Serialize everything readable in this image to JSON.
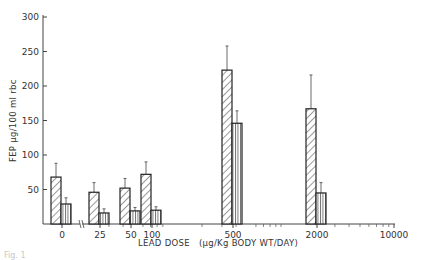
{
  "chart_data": {
    "type": "bar",
    "title": "",
    "xlabel": "LEAD DOSE (µg/Kg BODY WT/DAY)",
    "ylabel": "FEP µg/100 ml rbc",
    "ylim": [
      0,
      300
    ],
    "yticks": [
      50,
      100,
      150,
      200,
      250,
      300
    ],
    "categories": [
      "0",
      "25",
      "50",
      "100",
      "500",
      "2000"
    ],
    "x_tick_labels": [
      "0",
      "25",
      "50",
      "100",
      "500",
      "2000",
      "10000"
    ],
    "x_scale": "log (with axis break between 0 and 25)",
    "grid": false,
    "legend": null,
    "series": [
      {
        "name": "hatched (diagonal)",
        "pattern": "diagonal-hatch",
        "values": [
          68,
          46,
          52,
          72,
          223,
          167
        ],
        "error_upper": [
          88,
          60,
          66,
          90,
          258,
          216
        ]
      },
      {
        "name": "vertical-lined",
        "pattern": "vertical-lines",
        "values": [
          29,
          16,
          19,
          20,
          146,
          45
        ],
        "error_upper": [
          38,
          22,
          24,
          25,
          164,
          60
        ]
      }
    ]
  },
  "axes": {
    "y_title": "FEP µg/100 ml rbc",
    "x_title": "LEAD DOSE   (µg/Kg BODY WT/DAY)",
    "y_ticks": [
      "50",
      "100",
      "150",
      "200",
      "250",
      "300"
    ],
    "x_ticks": [
      "0",
      "25",
      "50",
      "100",
      "500",
      "2000",
      "10000"
    ]
  },
  "caption": "Fig. 1"
}
